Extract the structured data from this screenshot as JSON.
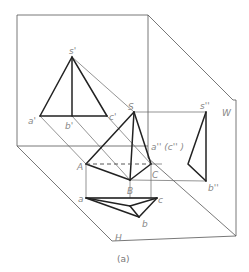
{
  "figure": {
    "caption": "(a)"
  },
  "planes": {
    "V": "V",
    "H": "H",
    "W": "W"
  },
  "labels": {
    "s_v": "s'",
    "a_v": "a'",
    "b_v": "b'",
    "c_v": "c'",
    "S": "S",
    "A": "A",
    "B": "B",
    "C": "C",
    "a_h": "a",
    "b_h": "b",
    "c_h": "c",
    "s_w": "s''",
    "ac_w": "a'' (c'' )",
    "b_w": "b''"
  },
  "colors": {
    "frame": "#555555",
    "edge": "#222222",
    "label": "#888888"
  }
}
